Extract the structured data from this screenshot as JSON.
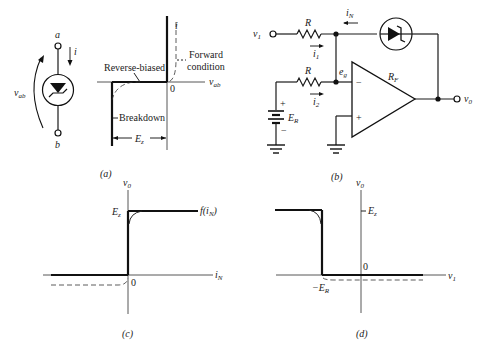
{
  "figure": {
    "panel_a": {
      "caption": "(a)",
      "symbol": {
        "terminal_top": "a",
        "terminal_bottom": "b",
        "current_label": "i",
        "voltage_label": "v",
        "voltage_sub": "ab"
      },
      "graph": {
        "y_axis_label": "i",
        "x_axis_label": "v",
        "x_axis_sub": "ab",
        "origin_label": "0",
        "reverse_label": "Reverse-biased",
        "forward_label_1": "Forward",
        "forward_label_2": "condition",
        "breakdown_label": "Breakdown",
        "ez_label": "E",
        "ez_sub": "z"
      }
    },
    "panel_b": {
      "caption": "(b)",
      "input_label": "v",
      "input_sub": "1",
      "r1_label": "R",
      "r2_label": "R",
      "i1_label": "i",
      "i1_sub": "1",
      "i2_label": "i",
      "i2_sub": "2",
      "in_label": "i",
      "in_sub": "N",
      "eg_label": "e",
      "eg_sub": "g",
      "rf_label": "R",
      "rf_sub": "F",
      "battery_label": "E",
      "battery_sub": "R",
      "plus": "+",
      "minus": "−",
      "output_label": "v",
      "output_sub": "0"
    },
    "panel_c": {
      "caption": "(c)",
      "y_axis_label": "v",
      "y_axis_sub": "0",
      "x_axis_label": "i",
      "x_axis_sub": "N",
      "level_label": "E",
      "level_sub": "z",
      "curve_label": "f(i",
      "curve_sub": "N",
      "curve_close": ")",
      "origin_label": "0"
    },
    "panel_d": {
      "caption": "(d)",
      "y_axis_label": "v",
      "y_axis_sub": "0",
      "x_axis_label": "v",
      "x_axis_sub": "1",
      "level_label": "E",
      "level_sub": "z",
      "threshold_label": "−E",
      "threshold_sub": "R",
      "origin_label": "0"
    }
  }
}
